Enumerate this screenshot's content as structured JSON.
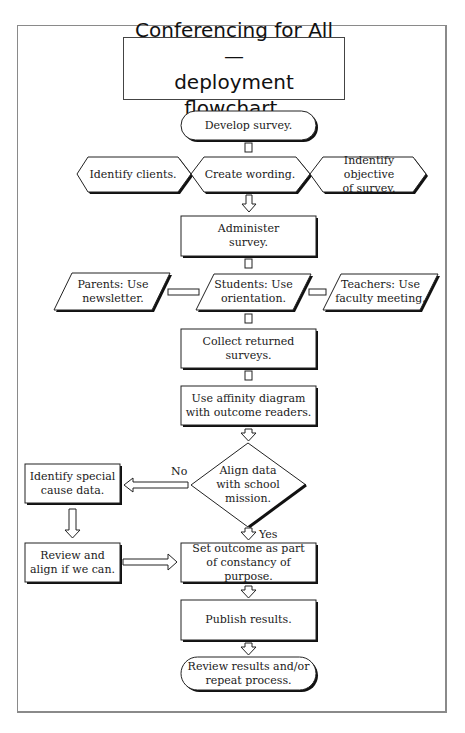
{
  "title": "Conferencing for All —\ndeployment flowchart.",
  "nodes": {
    "develop": "Develop survey.",
    "identify_clients": "Identify clients.",
    "create_wording": "Create wording.",
    "identify_objective": "Indentify objective\nof survey.",
    "administer": "Administer\nsurvey.",
    "parents": "Parents: Use\nnewsletter.",
    "students": "Students: Use\norientation.",
    "teachers": "Teachers: Use\nfaculty meeting.",
    "collect": "Collect returned\nsurveys.",
    "affinity": "Use affinity diagram\nwith outcome readers.",
    "decision": "Align data\nwith school\nmission.",
    "special_cause": "Identify special\ncause data.",
    "review_align": "Review and\nalign if we can.",
    "set_outcome": "Set outcome as part\nof constancy of purpose.",
    "publish": "Publish results.",
    "review_repeat": "Review results and/or\nrepeat process."
  },
  "edges": {
    "no_label": "No",
    "yes_label": "Yes"
  },
  "colors": {
    "stroke": "#222222",
    "shadow": "#111111",
    "frame": "#8a8a8a",
    "background": "#ffffff"
  }
}
